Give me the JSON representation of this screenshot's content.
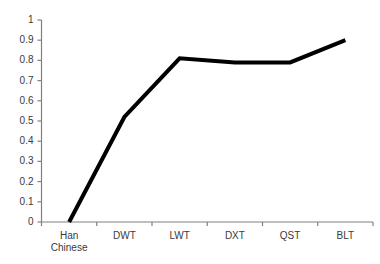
{
  "chart_data": {
    "type": "line",
    "title": "",
    "subtitle": "",
    "xlabel": "",
    "ylabel": "",
    "categories": [
      "Han Chinese",
      "DWT",
      "LWT",
      "DXT",
      "QST",
      "BLT"
    ],
    "values": [
      0,
      0.52,
      0.81,
      0.79,
      0.79,
      0.9
    ],
    "series": [
      {
        "name": "",
        "values": [
          0,
          0.52,
          0.81,
          0.79,
          0.79,
          0.9
        ]
      }
    ],
    "ylim": [
      0,
      1
    ],
    "ytick_values": [
      0,
      0.1,
      0.2,
      0.3,
      0.4,
      0.5,
      0.6,
      0.7,
      0.8,
      0.9,
      1
    ],
    "ytick_labels": [
      "0",
      "0.1",
      "0.2",
      "0.3",
      "0.4",
      "0.5",
      "0.6",
      "0.7",
      "0.8",
      "0.9",
      "1"
    ],
    "xtick_labels": [
      [
        "Han",
        "Chinese"
      ],
      [
        "DWT"
      ],
      [
        "LWT"
      ],
      [
        "DXT"
      ],
      [
        "QST"
      ],
      [
        "BLT"
      ]
    ],
    "grid": false,
    "legend": "none",
    "line_color": "#000000",
    "line_width": 4,
    "axis_color": "#808080",
    "text_color": "#3a3a3a",
    "background_color": "#ffffff"
  }
}
